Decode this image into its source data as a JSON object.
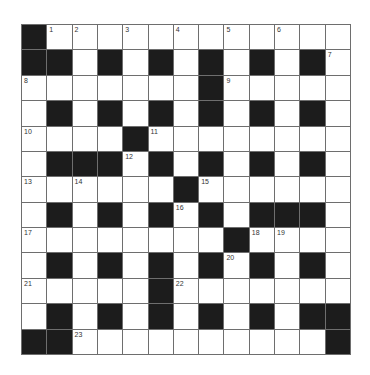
{
  "puzzle": {
    "rows": 13,
    "cols": 13,
    "grid": [
      "#............##",
      "##.#.#.#.#.#.",
      ".......#.....",
      ".#.#.#.#.#.#.",
      "....#........",
      ".###.#.#.#.#.",
      "......#......",
      ".#.#.#.#.###.",
      "........#....",
      ".#.#.#.#.#.#.",
      ".....#.......",
      ".#.#.#.#.#.##",
      "##..........#"
    ],
    "numbers": [
      {
        "row": 0,
        "col": 1,
        "label": "1"
      },
      {
        "row": 0,
        "col": 2,
        "label": "2"
      },
      {
        "row": 0,
        "col": 4,
        "label": "3"
      },
      {
        "row": 0,
        "col": 6,
        "label": "4"
      },
      {
        "row": 0,
        "col": 8,
        "label": "5"
      },
      {
        "row": 0,
        "col": 10,
        "label": "6"
      },
      {
        "row": 1,
        "col": 12,
        "label": "7"
      },
      {
        "row": 2,
        "col": 0,
        "label": "8"
      },
      {
        "row": 2,
        "col": 8,
        "label": "9"
      },
      {
        "row": 4,
        "col": 0,
        "label": "10"
      },
      {
        "row": 4,
        "col": 5,
        "label": "11"
      },
      {
        "row": 5,
        "col": 4,
        "label": "12"
      },
      {
        "row": 6,
        "col": 0,
        "label": "13"
      },
      {
        "row": 6,
        "col": 2,
        "label": "14"
      },
      {
        "row": 6,
        "col": 7,
        "label": "15"
      },
      {
        "row": 7,
        "col": 6,
        "label": "16"
      },
      {
        "row": 8,
        "col": 0,
        "label": "17"
      },
      {
        "row": 8,
        "col": 9,
        "label": "18"
      },
      {
        "row": 8,
        "col": 10,
        "label": "19"
      },
      {
        "row": 9,
        "col": 8,
        "label": "20"
      },
      {
        "row": 10,
        "col": 0,
        "label": "21"
      },
      {
        "row": 10,
        "col": 6,
        "label": "22"
      },
      {
        "row": 12,
        "col": 2,
        "label": "23"
      }
    ],
    "colors": {
      "block": "#1c1c1c",
      "cell": "#ffffff",
      "line": "#6e6e6e",
      "number": "#333333"
    }
  }
}
